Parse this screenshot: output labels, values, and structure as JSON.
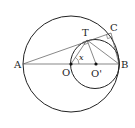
{
  "diagram": {
    "type": "geometry",
    "points": {
      "A": {
        "label": "A",
        "x": 23,
        "y": 64
      },
      "B": {
        "label": "B",
        "x": 119,
        "y": 64
      },
      "O": {
        "label": "O",
        "x": 71,
        "y": 64
      },
      "O_prime": {
        "label": "O'",
        "x": 96,
        "y": 64
      },
      "T": {
        "label": "T",
        "x": 87,
        "y": 40
      },
      "C": {
        "label": "C",
        "x": 111,
        "y": 33
      }
    },
    "circles": [
      {
        "name": "circle-O",
        "cx": 71,
        "cy": 64,
        "r": 48
      },
      {
        "name": "circle-O-prime",
        "cx": 95,
        "cy": 64,
        "r": 24.5
      }
    ],
    "angle_label": "x",
    "colors": {
      "stroke": "#222222",
      "thin_stroke": "#555555",
      "background": "#ffffff"
    }
  }
}
